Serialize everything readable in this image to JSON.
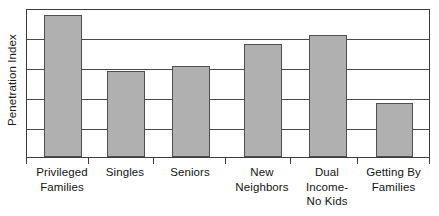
{
  "chart_data": {
    "type": "bar",
    "title": "",
    "subtitle": "",
    "xlabel": "",
    "ylabel": "Penetration Index",
    "categories": [
      "Privileged Families",
      "Singles",
      "Seniors",
      "New Neighbors",
      "Dual Income-No Kids",
      "Getting By Families"
    ],
    "category_lines": [
      [
        "Privileged",
        "Families"
      ],
      [
        "Singles"
      ],
      [
        "Seniors"
      ],
      [
        "New",
        "Neighbors"
      ],
      [
        "Dual",
        "Income-",
        "No Kids"
      ],
      [
        "Getting By",
        "Families"
      ]
    ],
    "values": [
      4.73,
      2.87,
      3.03,
      3.77,
      4.07,
      1.8
    ],
    "ylim": [
      0,
      4.97
    ],
    "y_tick_labels": [],
    "x_tick_labels": [],
    "gridlines": {
      "visible": true,
      "axis": "y",
      "values": [
        1.0,
        2.0,
        3.0,
        4.0
      ],
      "count": 4
    },
    "legend": {
      "visible": false,
      "position": "none",
      "entries": []
    },
    "annotations": [],
    "colors": {
      "bar_fill": "#b0b0b0",
      "bar_border": "#4f4f4f",
      "gridline": "#4a4a4a",
      "axis_frame": "#3c3c3c",
      "background": "#ffffff",
      "text": "#141414"
    }
  }
}
